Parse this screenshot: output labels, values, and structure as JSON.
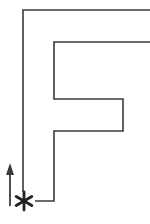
{
  "diagram": {
    "colors": {
      "stroke": "#3a3a3a",
      "background": "#ffffff"
    },
    "path_points": "150,10 23,10 23,192",
    "inner_path_points": "150,42 54,42 54,99 123,99 123,131 54,131 54,201 35,201",
    "start_marker": {
      "symbol": "asterisk",
      "cx": 24,
      "cy": 201
    },
    "arrow": {
      "direction": "up",
      "x": 10,
      "y_start": 206,
      "y_end": 165
    }
  }
}
